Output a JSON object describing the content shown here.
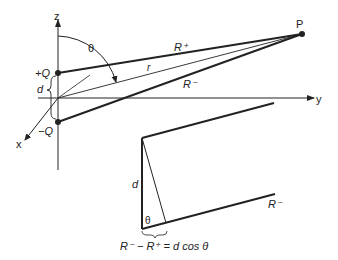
{
  "diagram": {
    "axes": {
      "z": "z",
      "y": "y",
      "x": "x"
    },
    "charges": {
      "positive": "+Q",
      "negative": "−Q"
    },
    "separation_label": "d",
    "angle_label": "θ",
    "point_label": "P",
    "distances": {
      "r": "r",
      "r_plus": "R⁺",
      "r_minus": "R⁻"
    },
    "inset": {
      "separation_label": "d",
      "angle_label": "θ",
      "r_minus_label": "R⁻",
      "equation": "R⁻ − R⁺ = d cos θ"
    },
    "colors": {
      "line": "#222222",
      "background": "#ffffff"
    }
  }
}
